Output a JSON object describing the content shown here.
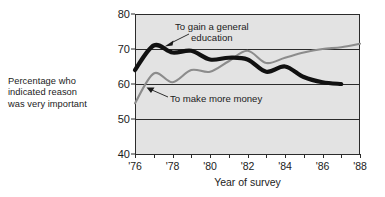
{
  "caption": {
    "line1": "Percentage who",
    "line2": "indicated reason",
    "line3": "was very important"
  },
  "axis": {
    "x_title": "Year of survey",
    "y_ticks": [
      "40",
      "50",
      "60",
      "70",
      "80"
    ],
    "x_ticks": [
      "'76",
      "'78",
      "'80",
      "'82",
      "'84",
      "'86",
      "'88"
    ]
  },
  "annotations": {
    "education_line1": "To gain a general",
    "education_line2": "education",
    "money": "To make more money"
  },
  "colors": {
    "plot_background": "#e3e3e3",
    "axis": "#2b2b2b",
    "series_education": "#111111",
    "series_money": "#8c8c8c",
    "text": "#1b1b1b"
  },
  "chart_data": {
    "type": "line",
    "title": "",
    "subtitle": "",
    "xlabel": "Year of survey",
    "ylabel": "Percentage who indicated reason was very important",
    "xlim": [
      1976,
      1988
    ],
    "ylim": [
      40,
      80
    ],
    "y_tick_values": [
      40,
      50,
      60,
      70,
      80
    ],
    "x_tick_values": [
      1976,
      1978,
      1980,
      1982,
      1984,
      1986,
      1988
    ],
    "x_minor_tick_values": [
      1977,
      1979,
      1981,
      1983,
      1985,
      1987
    ],
    "grid": "horizontal",
    "legend": "annotations-inline",
    "x": [
      1976,
      1977,
      1978,
      1979,
      1980,
      1981,
      1982,
      1983,
      1984,
      1985,
      1986,
      1987
    ],
    "series": [
      {
        "name": "To gain a general education",
        "color": "#111111",
        "linewidth": "thick",
        "values": [
          64.0,
          71.0,
          69.0,
          69.5,
          67.0,
          67.5,
          67.0,
          63.5,
          65.0,
          62.0,
          60.5,
          60.0
        ]
      },
      {
        "name": "To make more money",
        "color": "#8c8c8c",
        "linewidth": "thin",
        "x": [
          1976,
          1977,
          1978,
          1979,
          1980,
          1981,
          1982,
          1983,
          1984,
          1985,
          1986,
          1987,
          1988
        ],
        "values": [
          54.5,
          63.0,
          60.5,
          64.0,
          63.5,
          66.5,
          69.5,
          66.0,
          67.5,
          69.0,
          70.0,
          70.5,
          71.5
        ]
      }
    ],
    "annotations": [
      {
        "text": "To gain a general education",
        "points_to_series": "To gain a general education",
        "points_to_x": 1977.4,
        "points_to_y": 70.2
      },
      {
        "text": "To make more money",
        "points_to_series": "To make more money",
        "points_to_x": 1976.45,
        "points_to_y": 58.5
      }
    ]
  }
}
